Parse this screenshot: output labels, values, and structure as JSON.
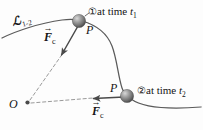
{
  "figure": {
    "background_color": "#fdfdfd",
    "stroke_color": "#4a4a4a",
    "text_color": "#141414"
  },
  "labels": {
    "curve": {
      "symbol": "ℒ",
      "subscript": "1-2"
    },
    "state1": {
      "marker": "①",
      "text": "at time ",
      "var": "t",
      "subscript": "1"
    },
    "state2": {
      "marker": "②",
      "text": "at time ",
      "var": "t",
      "subscript": "2"
    },
    "point1": "P",
    "point2": "P",
    "origin": "O",
    "force1": {
      "arrow": "→",
      "symbol": "F",
      "subscript": "c"
    },
    "force2": {
      "arrow": "→",
      "symbol": "F",
      "subscript": "c"
    }
  },
  "geometry": {
    "trajectory_note": "smooth curve from left edge through P at t1, bending right and down to P at t2, continuing to right edge",
    "origin_point": [
      27,
      103
    ],
    "particle1_center": [
      79,
      21
    ],
    "particle2_center": [
      127,
      96
    ],
    "force1_direction": "down-left toward O",
    "force2_direction": "left toward O",
    "dashed_line_count": 2
  }
}
